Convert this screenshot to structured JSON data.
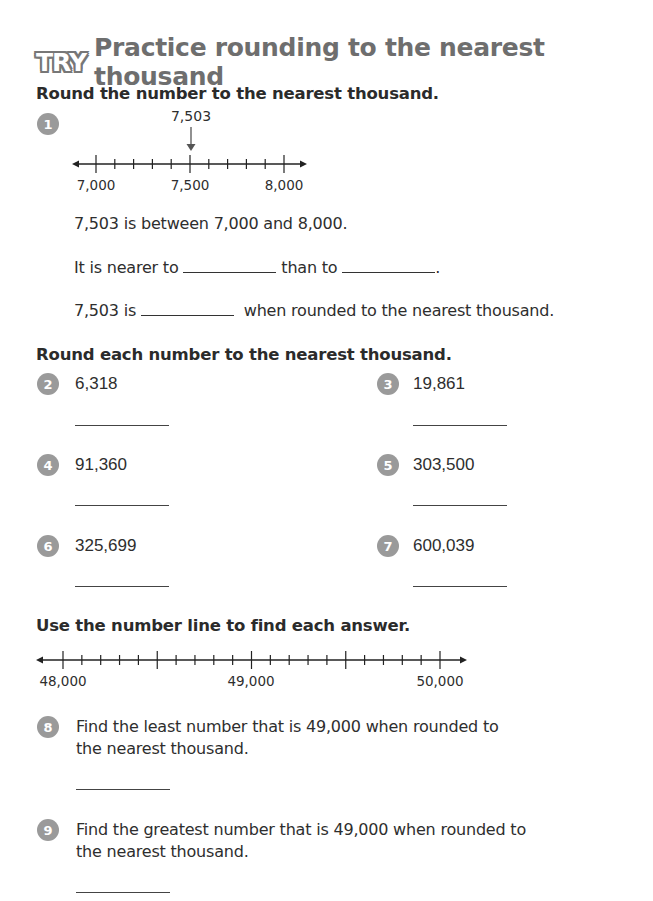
{
  "header": {
    "badge": "TRY",
    "title": "Practice rounding to the nearest thousand"
  },
  "section1": {
    "instruction": "Round the number to the nearest thousand.",
    "question": {
      "number": "1",
      "marked_value": "7,503",
      "number_line": {
        "start": 7000,
        "end": 8000,
        "step": 100,
        "labels": [
          "7,000",
          "7,500",
          "8,000"
        ]
      },
      "sentence1": "7,503 is between 7,000 and 8,000.",
      "sentence2_part1": "It is nearer to",
      "sentence2_part2": "than to",
      "sentence2_end": ".",
      "sentence3_part1": "7,503 is",
      "sentence3_part2": "when rounded to the nearest thousand."
    }
  },
  "section2": {
    "instruction": "Round each number to the nearest thousand.",
    "questions": [
      {
        "number": "2",
        "value": "6,318"
      },
      {
        "number": "3",
        "value": "19,861"
      },
      {
        "number": "4",
        "value": "91,360"
      },
      {
        "number": "5",
        "value": "303,500"
      },
      {
        "number": "6",
        "value": "325,699"
      },
      {
        "number": "7",
        "value": "600,039"
      }
    ]
  },
  "section3": {
    "instruction": "Use the number line to find each answer.",
    "number_line": {
      "start": 48000,
      "end": 50000,
      "step": 100,
      "labels": [
        "48,000",
        "49,000",
        "50,000"
      ]
    },
    "questions": [
      {
        "number": "8",
        "line1": "Find the least number that is 49,000 when rounded to",
        "line2": "the nearest thousand."
      },
      {
        "number": "9",
        "line1": "Find the greatest number that is 49,000 when rounded to",
        "line2": "the nearest thousand."
      }
    ]
  },
  "colors": {
    "badge_gray": "#9a9a9a",
    "title_gray": "#6e6e6e",
    "text": "#2e2e2e"
  }
}
